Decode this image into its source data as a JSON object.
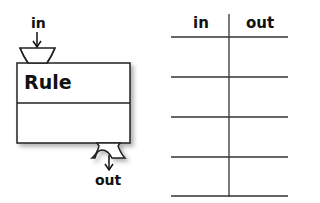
{
  "diagram": {
    "rule_block": {
      "title": "Rule",
      "input_label": "in",
      "output_label": "out"
    },
    "table": {
      "headers": [
        "in",
        "out"
      ],
      "rows": [
        [
          "",
          ""
        ],
        [
          "",
          ""
        ],
        [
          "",
          ""
        ],
        [
          "",
          ""
        ]
      ]
    }
  }
}
